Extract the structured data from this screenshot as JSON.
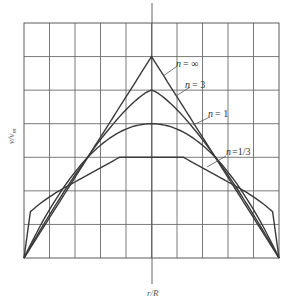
{
  "chart_data": {
    "type": "line",
    "title": "",
    "xlabel": "r/R",
    "ylabel": "v/v_m",
    "xlim": [
      -1,
      1
    ],
    "ylim": [
      0,
      3.5
    ],
    "grid": true,
    "grid_cols": 10,
    "grid_rows": 7,
    "legend": "inline labels with leader lines (right side)",
    "x": [
      -1.0,
      -0.8,
      -0.6,
      -0.4,
      -0.2,
      0.0,
      0.2,
      0.4,
      0.6,
      0.8,
      1.0
    ],
    "series": [
      {
        "name": "n = ∞",
        "label_main": "n",
        "label_rest": " = ∞",
        "peak": 3.0,
        "values": [
          0.0,
          0.6,
          1.2,
          1.8,
          2.4,
          3.0,
          2.4,
          1.8,
          1.2,
          0.6,
          0.0
        ]
      },
      {
        "name": "n = 3",
        "label_main": "n",
        "label_rest": " = 3",
        "peak": 2.5,
        "values": [
          0.0,
          0.87,
          1.49,
          1.96,
          2.33,
          2.5,
          2.33,
          1.96,
          1.49,
          0.87,
          0.0
        ]
      },
      {
        "name": "n = 1",
        "label_main": "n",
        "label_rest": " = 1",
        "peak": 2.0,
        "values": [
          0.0,
          0.72,
          1.28,
          1.68,
          1.92,
          2.0,
          1.92,
          1.68,
          1.28,
          0.72,
          0.0
        ]
      },
      {
        "name": "n = 1/3",
        "label_main": "n",
        "label_rest": " =1/3",
        "peak": 1.5,
        "values": [
          0.0,
          0.9,
          1.18,
          1.41,
          1.5,
          1.5,
          1.5,
          1.41,
          1.18,
          0.9,
          0.0
        ]
      }
    ]
  },
  "labels": {
    "n_inf": "= ∞",
    "n_3": "= 3",
    "n_1": "= 1",
    "n_13": "=1/3",
    "n": "n",
    "xaxis": "r/R",
    "yaxis": "v/v",
    "yaxis_sub": "m"
  }
}
